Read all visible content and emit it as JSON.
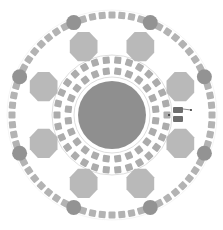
{
  "diagram": {
    "type": "circular-floor-plan",
    "center": [
      112,
      115
    ],
    "background": "#ffffff",
    "colors": {
      "central_circle": "#8f8f8f",
      "column": "#939393",
      "octagon": "#b9b9b9",
      "seat": "#b3b3b3",
      "inner_seat": "#acacac",
      "ring_line": "#d4d4d4",
      "object": "#6e6e6e"
    },
    "central_circle": {
      "radius": 34
    },
    "outer_ring": {
      "radius": 100,
      "seat_count": 64,
      "seat_size": 7
    },
    "columns": {
      "count": 8,
      "radius": 100,
      "size": 7.5,
      "offset_deg": 22.5
    },
    "octagons": {
      "count": 8,
      "radius": 74,
      "size": 15,
      "offset_deg": 22.5
    },
    "inner_rings": [
      {
        "radius": 55,
        "seat_count": 30,
        "seat_size": 7
      },
      {
        "radius": 44,
        "seat_count": 24,
        "seat_size": 7
      }
    ],
    "ring_lines": [
      60,
      38
    ],
    "object": {
      "label": "",
      "x": 178,
      "y": 115
    }
  }
}
